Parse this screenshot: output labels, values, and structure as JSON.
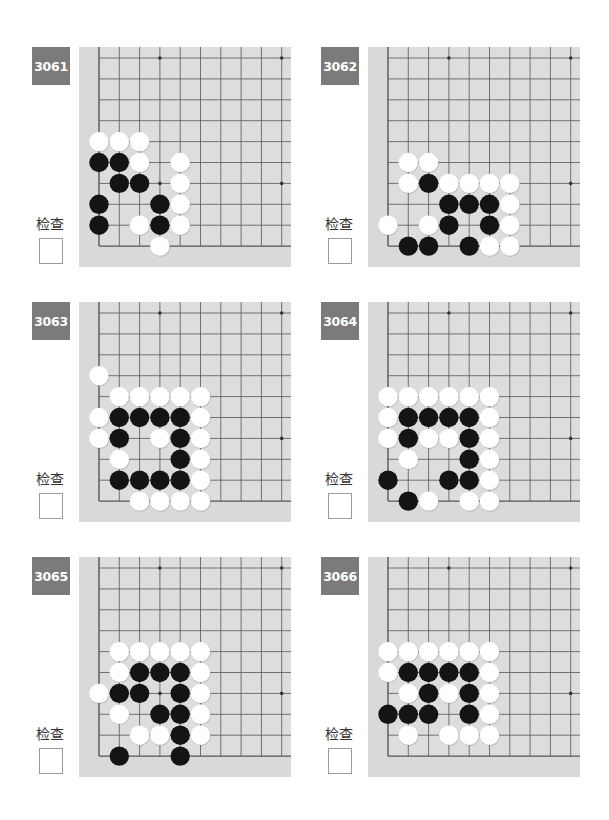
{
  "check_label": "检查",
  "colors": {
    "board": "#d9d9d9",
    "grid_fill": "#dddddd",
    "line": "#555555",
    "label_bg": "#7b7b7b",
    "black": "#141414",
    "white": "#ffffff"
  },
  "problems": [
    {
      "number": "3061",
      "pos": [
        32,
        47
      ],
      "stones": [
        {
          "r": 4,
          "c": 0,
          "s": "W"
        },
        {
          "r": 4,
          "c": 1,
          "s": "W"
        },
        {
          "r": 4,
          "c": 2,
          "s": "W"
        },
        {
          "r": 5,
          "c": 0,
          "s": "B"
        },
        {
          "r": 5,
          "c": 1,
          "s": "B"
        },
        {
          "r": 5,
          "c": 2,
          "s": "W"
        },
        {
          "r": 5,
          "c": 4,
          "s": "W"
        },
        {
          "r": 6,
          "c": 1,
          "s": "B"
        },
        {
          "r": 6,
          "c": 2,
          "s": "B"
        },
        {
          "r": 6,
          "c": 4,
          "s": "W"
        },
        {
          "r": 7,
          "c": 0,
          "s": "B"
        },
        {
          "r": 7,
          "c": 3,
          "s": "B"
        },
        {
          "r": 7,
          "c": 4,
          "s": "W"
        },
        {
          "r": 8,
          "c": 0,
          "s": "B"
        },
        {
          "r": 8,
          "c": 2,
          "s": "W"
        },
        {
          "r": 8,
          "c": 3,
          "s": "B"
        },
        {
          "r": 8,
          "c": 4,
          "s": "W"
        },
        {
          "r": 9,
          "c": 3,
          "s": "W"
        }
      ]
    },
    {
      "number": "3062",
      "pos": [
        321,
        47
      ],
      "stones": [
        {
          "r": 5,
          "c": 1,
          "s": "W"
        },
        {
          "r": 5,
          "c": 2,
          "s": "W"
        },
        {
          "r": 6,
          "c": 1,
          "s": "W"
        },
        {
          "r": 6,
          "c": 2,
          "s": "B"
        },
        {
          "r": 6,
          "c": 3,
          "s": "W"
        },
        {
          "r": 6,
          "c": 4,
          "s": "W"
        },
        {
          "r": 6,
          "c": 5,
          "s": "W"
        },
        {
          "r": 6,
          "c": 6,
          "s": "W"
        },
        {
          "r": 7,
          "c": 3,
          "s": "B"
        },
        {
          "r": 7,
          "c": 4,
          "s": "B"
        },
        {
          "r": 7,
          "c": 5,
          "s": "B"
        },
        {
          "r": 7,
          "c": 6,
          "s": "W"
        },
        {
          "r": 8,
          "c": 0,
          "s": "W"
        },
        {
          "r": 8,
          "c": 2,
          "s": "W"
        },
        {
          "r": 8,
          "c": 3,
          "s": "B"
        },
        {
          "r": 8,
          "c": 5,
          "s": "B"
        },
        {
          "r": 8,
          "c": 6,
          "s": "W"
        },
        {
          "r": 9,
          "c": 1,
          "s": "B"
        },
        {
          "r": 9,
          "c": 2,
          "s": "B"
        },
        {
          "r": 9,
          "c": 4,
          "s": "B"
        },
        {
          "r": 9,
          "c": 5,
          "s": "W"
        },
        {
          "r": 9,
          "c": 6,
          "s": "W"
        }
      ]
    },
    {
      "number": "3063",
      "pos": [
        32,
        302
      ],
      "stones": [
        {
          "r": 3,
          "c": 0,
          "s": "W"
        },
        {
          "r": 4,
          "c": 1,
          "s": "W"
        },
        {
          "r": 4,
          "c": 2,
          "s": "W"
        },
        {
          "r": 4,
          "c": 3,
          "s": "W"
        },
        {
          "r": 4,
          "c": 4,
          "s": "W"
        },
        {
          "r": 4,
          "c": 5,
          "s": "W"
        },
        {
          "r": 5,
          "c": 0,
          "s": "W"
        },
        {
          "r": 5,
          "c": 1,
          "s": "B"
        },
        {
          "r": 5,
          "c": 2,
          "s": "B"
        },
        {
          "r": 5,
          "c": 3,
          "s": "B"
        },
        {
          "r": 5,
          "c": 4,
          "s": "B"
        },
        {
          "r": 5,
          "c": 5,
          "s": "W"
        },
        {
          "r": 6,
          "c": 0,
          "s": "W"
        },
        {
          "r": 6,
          "c": 1,
          "s": "B"
        },
        {
          "r": 6,
          "c": 3,
          "s": "W"
        },
        {
          "r": 6,
          "c": 4,
          "s": "B"
        },
        {
          "r": 6,
          "c": 5,
          "s": "W"
        },
        {
          "r": 7,
          "c": 1,
          "s": "W"
        },
        {
          "r": 7,
          "c": 4,
          "s": "B"
        },
        {
          "r": 7,
          "c": 5,
          "s": "W"
        },
        {
          "r": 8,
          "c": 1,
          "s": "B"
        },
        {
          "r": 8,
          "c": 2,
          "s": "B"
        },
        {
          "r": 8,
          "c": 3,
          "s": "B"
        },
        {
          "r": 8,
          "c": 4,
          "s": "B"
        },
        {
          "r": 8,
          "c": 5,
          "s": "W"
        },
        {
          "r": 9,
          "c": 2,
          "s": "W"
        },
        {
          "r": 9,
          "c": 3,
          "s": "W"
        },
        {
          "r": 9,
          "c": 4,
          "s": "W"
        },
        {
          "r": 9,
          "c": 5,
          "s": "W"
        }
      ]
    },
    {
      "number": "3064",
      "pos": [
        321,
        302
      ],
      "stones": [
        {
          "r": 4,
          "c": 0,
          "s": "W"
        },
        {
          "r": 4,
          "c": 1,
          "s": "W"
        },
        {
          "r": 4,
          "c": 2,
          "s": "W"
        },
        {
          "r": 4,
          "c": 3,
          "s": "W"
        },
        {
          "r": 4,
          "c": 4,
          "s": "W"
        },
        {
          "r": 4,
          "c": 5,
          "s": "W"
        },
        {
          "r": 5,
          "c": 0,
          "s": "W"
        },
        {
          "r": 5,
          "c": 1,
          "s": "B"
        },
        {
          "r": 5,
          "c": 2,
          "s": "B"
        },
        {
          "r": 5,
          "c": 3,
          "s": "B"
        },
        {
          "r": 5,
          "c": 4,
          "s": "B"
        },
        {
          "r": 5,
          "c": 5,
          "s": "W"
        },
        {
          "r": 6,
          "c": 0,
          "s": "W"
        },
        {
          "r": 6,
          "c": 1,
          "s": "B"
        },
        {
          "r": 6,
          "c": 2,
          "s": "W"
        },
        {
          "r": 6,
          "c": 3,
          "s": "W"
        },
        {
          "r": 6,
          "c": 4,
          "s": "B"
        },
        {
          "r": 6,
          "c": 5,
          "s": "W"
        },
        {
          "r": 7,
          "c": 1,
          "s": "W"
        },
        {
          "r": 7,
          "c": 4,
          "s": "B"
        },
        {
          "r": 7,
          "c": 5,
          "s": "W"
        },
        {
          "r": 8,
          "c": 0,
          "s": "B"
        },
        {
          "r": 8,
          "c": 3,
          "s": "B"
        },
        {
          "r": 8,
          "c": 4,
          "s": "B"
        },
        {
          "r": 8,
          "c": 5,
          "s": "W"
        },
        {
          "r": 9,
          "c": 1,
          "s": "B"
        },
        {
          "r": 9,
          "c": 2,
          "s": "W"
        },
        {
          "r": 9,
          "c": 4,
          "s": "W"
        },
        {
          "r": 9,
          "c": 5,
          "s": "W"
        }
      ]
    },
    {
      "number": "3065",
      "pos": [
        32,
        557
      ],
      "stones": [
        {
          "r": 4,
          "c": 1,
          "s": "W"
        },
        {
          "r": 4,
          "c": 2,
          "s": "W"
        },
        {
          "r": 4,
          "c": 3,
          "s": "W"
        },
        {
          "r": 4,
          "c": 4,
          "s": "W"
        },
        {
          "r": 4,
          "c": 5,
          "s": "W"
        },
        {
          "r": 5,
          "c": 1,
          "s": "W"
        },
        {
          "r": 5,
          "c": 2,
          "s": "B"
        },
        {
          "r": 5,
          "c": 3,
          "s": "B"
        },
        {
          "r": 5,
          "c": 4,
          "s": "B"
        },
        {
          "r": 5,
          "c": 5,
          "s": "W"
        },
        {
          "r": 6,
          "c": 0,
          "s": "W"
        },
        {
          "r": 6,
          "c": 1,
          "s": "B"
        },
        {
          "r": 6,
          "c": 2,
          "s": "B"
        },
        {
          "r": 6,
          "c": 4,
          "s": "B"
        },
        {
          "r": 6,
          "c": 5,
          "s": "W"
        },
        {
          "r": 7,
          "c": 1,
          "s": "W"
        },
        {
          "r": 7,
          "c": 3,
          "s": "B"
        },
        {
          "r": 7,
          "c": 4,
          "s": "B"
        },
        {
          "r": 7,
          "c": 5,
          "s": "W"
        },
        {
          "r": 8,
          "c": 2,
          "s": "W"
        },
        {
          "r": 8,
          "c": 3,
          "s": "W"
        },
        {
          "r": 8,
          "c": 4,
          "s": "B"
        },
        {
          "r": 8,
          "c": 5,
          "s": "W"
        },
        {
          "r": 9,
          "c": 1,
          "s": "B"
        },
        {
          "r": 9,
          "c": 4,
          "s": "B"
        }
      ]
    },
    {
      "number": "3066",
      "pos": [
        321,
        557
      ],
      "stones": [
        {
          "r": 4,
          "c": 0,
          "s": "W"
        },
        {
          "r": 4,
          "c": 1,
          "s": "W"
        },
        {
          "r": 4,
          "c": 2,
          "s": "W"
        },
        {
          "r": 4,
          "c": 3,
          "s": "W"
        },
        {
          "r": 4,
          "c": 4,
          "s": "W"
        },
        {
          "r": 4,
          "c": 5,
          "s": "W"
        },
        {
          "r": 5,
          "c": 0,
          "s": "W"
        },
        {
          "r": 5,
          "c": 1,
          "s": "B"
        },
        {
          "r": 5,
          "c": 2,
          "s": "B"
        },
        {
          "r": 5,
          "c": 3,
          "s": "B"
        },
        {
          "r": 5,
          "c": 4,
          "s": "B"
        },
        {
          "r": 5,
          "c": 5,
          "s": "W"
        },
        {
          "r": 6,
          "c": 1,
          "s": "W"
        },
        {
          "r": 6,
          "c": 2,
          "s": "B"
        },
        {
          "r": 6,
          "c": 3,
          "s": "W"
        },
        {
          "r": 6,
          "c": 4,
          "s": "B"
        },
        {
          "r": 6,
          "c": 5,
          "s": "W"
        },
        {
          "r": 7,
          "c": 0,
          "s": "B"
        },
        {
          "r": 7,
          "c": 1,
          "s": "B"
        },
        {
          "r": 7,
          "c": 2,
          "s": "B"
        },
        {
          "r": 7,
          "c": 4,
          "s": "B"
        },
        {
          "r": 7,
          "c": 5,
          "s": "W"
        },
        {
          "r": 8,
          "c": 1,
          "s": "W"
        },
        {
          "r": 8,
          "c": 3,
          "s": "W"
        },
        {
          "r": 8,
          "c": 4,
          "s": "W"
        },
        {
          "r": 8,
          "c": 5,
          "s": "W"
        }
      ]
    }
  ],
  "board_geometry": {
    "cols": 10,
    "rows": 10,
    "origin_x": 20,
    "origin_y": 11,
    "dx": 20.3,
    "dy": 20.9,
    "stone_d": 20,
    "star_points": [
      [
        0,
        3
      ],
      [
        0,
        9
      ],
      [
        6,
        3
      ],
      [
        6,
        9
      ]
    ]
  }
}
